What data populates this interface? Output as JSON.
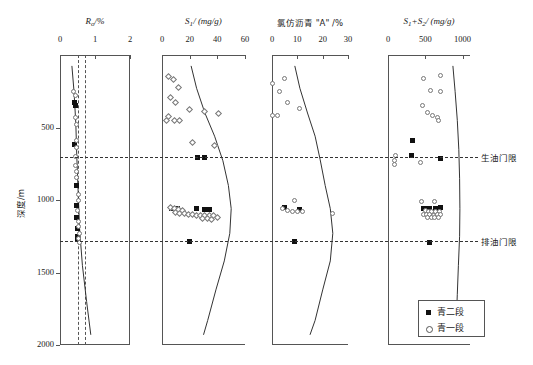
{
  "figure": {
    "y_axis": {
      "label": "深度/m",
      "ticks": [
        500,
        1000,
        1500,
        2000
      ],
      "min": 0,
      "max": 2000
    },
    "annotations": [
      {
        "name": "oil-generation-threshold",
        "label": "生油门限",
        "depth": 700
      },
      {
        "name": "oil-expulsion-threshold",
        "label": "排油门限",
        "depth": 1280
      }
    ],
    "legend": {
      "items": [
        {
          "label": "青二段",
          "marker": "filled-square"
        },
        {
          "label": "青一段",
          "marker": "open-circle"
        }
      ]
    }
  },
  "chart_data": [
    {
      "type": "scatter",
      "title": "R",
      "title_sub": "o",
      "title_unit": "/%",
      "xlabel": "Ro/%",
      "ylabel": "深度/m",
      "xlim": [
        0,
        2
      ],
      "ylim": [
        0,
        2000
      ],
      "xticks": [
        0,
        1,
        2
      ],
      "grid": false,
      "reference_lines": [
        0.5,
        0.7
      ],
      "series": [
        {
          "name": "青二段",
          "marker": "filled-square",
          "points": [
            [
              0.42,
              330
            ],
            [
              0.45,
              345
            ],
            [
              0.4,
              620
            ],
            [
              0.46,
              900
            ],
            [
              0.47,
              1040
            ],
            [
              0.48,
              1120
            ],
            [
              0.49,
              1195
            ],
            [
              0.5,
              1255
            ],
            [
              0.51,
              1275
            ]
          ]
        },
        {
          "name": "青一段",
          "marker": "open-circle",
          "points": [
            [
              0.38,
              250
            ],
            [
              0.43,
              280
            ],
            [
              0.44,
              430
            ],
            [
              0.46,
              480
            ],
            [
              0.48,
              590
            ],
            [
              0.47,
              640
            ],
            [
              0.45,
              700
            ],
            [
              0.44,
              760
            ],
            [
              0.46,
              800
            ],
            [
              0.48,
              845
            ],
            [
              0.52,
              960
            ],
            [
              0.53,
              1000
            ],
            [
              0.5,
              1075
            ],
            [
              0.52,
              1150
            ],
            [
              0.54,
              1180
            ],
            [
              0.55,
              1230
            ],
            [
              0.53,
              1265
            ],
            [
              0.56,
              1290
            ]
          ]
        }
      ],
      "trend_curve": [
        [
          0.34,
          75
        ],
        [
          0.4,
          250
        ],
        [
          0.45,
          470
        ],
        [
          0.48,
          700
        ],
        [
          0.52,
          950
        ],
        [
          0.56,
          1200
        ],
        [
          0.64,
          1450
        ],
        [
          0.76,
          1700
        ],
        [
          0.88,
          1930
        ]
      ]
    },
    {
      "type": "scatter",
      "title": "S",
      "title_sub": "1",
      "title_unit": "/ (mg/g)",
      "xlabel": "S1/(mg/g)",
      "ylabel": "深度/m",
      "xlim": [
        0,
        60
      ],
      "ylim": [
        0,
        2000
      ],
      "xticks": [
        0,
        20,
        40,
        60
      ],
      "grid": false,
      "series": [
        {
          "name": "青二段",
          "marker": "filled-square",
          "points": [
            [
              26,
              705
            ],
            [
              31,
              705
            ],
            [
              7,
              1060
            ],
            [
              9,
              1060
            ],
            [
              11,
              1060
            ],
            [
              25,
              1060
            ],
            [
              31,
              1065
            ],
            [
              34,
              1065
            ],
            [
              20,
              1285
            ]
          ]
        },
        {
          "name": "青一段",
          "marker": "open-diamond",
          "points": [
            [
              5,
              150
            ],
            [
              8,
              170
            ],
            [
              12,
              225
            ],
            [
              6,
              290
            ],
            [
              10,
              325
            ],
            [
              20,
              375
            ],
            [
              31,
              390
            ],
            [
              41,
              400
            ],
            [
              5,
              425
            ],
            [
              3,
              455
            ],
            [
              9,
              450
            ],
            [
              13,
              455
            ],
            [
              22,
              600
            ],
            [
              38,
              625
            ],
            [
              6,
              1055
            ],
            [
              9,
              1062
            ],
            [
              12,
              1068
            ],
            [
              15,
              1072
            ],
            [
              10,
              1085
            ],
            [
              13,
              1090
            ],
            [
              16,
              1095
            ],
            [
              19,
              1100
            ],
            [
              22,
              1100
            ],
            [
              25,
              1105
            ],
            [
              28,
              1108
            ],
            [
              31,
              1110
            ],
            [
              34,
              1108
            ],
            [
              37,
              1105
            ],
            [
              29,
              1128
            ],
            [
              33,
              1130
            ],
            [
              36,
              1132
            ],
            [
              40,
              1120
            ]
          ]
        }
      ],
      "trend_curve": [
        [
          21,
          75
        ],
        [
          25,
          230
        ],
        [
          31,
          400
        ],
        [
          38,
          560
        ],
        [
          44,
          730
        ],
        [
          48,
          900
        ],
        [
          50,
          1060
        ],
        [
          49,
          1230
        ],
        [
          45,
          1420
        ],
        [
          39,
          1620
        ],
        [
          33,
          1830
        ],
        [
          30,
          1930
        ]
      ]
    },
    {
      "type": "scatter",
      "title": "氯仿沥青 \"A\" /%",
      "xlabel": "氯仿沥青\"A\"/%",
      "ylabel": "深度/m",
      "xlim": [
        0,
        30
      ],
      "ylim": [
        0,
        2000
      ],
      "xticks": [
        0,
        10,
        20,
        30
      ],
      "grid": false,
      "series": [
        {
          "name": "青二段",
          "marker": "filled-square",
          "points": [
            [
              5,
              1055
            ],
            [
              11,
              1065
            ],
            [
              9,
              1285
            ]
          ]
        },
        {
          "name": "青一段",
          "marker": "open-circle",
          "points": [
            [
              5,
              160
            ],
            [
              0,
              195
            ],
            [
              3,
              250
            ],
            [
              6,
              330
            ],
            [
              11,
              370
            ],
            [
              0,
              415
            ],
            [
              2,
              420
            ],
            [
              9,
              1000
            ],
            [
              4,
              1060
            ],
            [
              6,
              1075
            ],
            [
              8,
              1080
            ],
            [
              10,
              1082
            ],
            [
              12,
              1082
            ],
            [
              24,
              1090
            ]
          ]
        }
      ],
      "trend_curve": [
        [
          9,
          75
        ],
        [
          11,
          230
        ],
        [
          14,
          400
        ],
        [
          17,
          560
        ],
        [
          19,
          720
        ],
        [
          21,
          900
        ],
        [
          23,
          1060
        ],
        [
          24,
          1230
        ],
        [
          23,
          1420
        ],
        [
          20,
          1620
        ],
        [
          17,
          1830
        ],
        [
          15,
          1930
        ]
      ]
    },
    {
      "type": "scatter",
      "title": "S",
      "title_sub": "1",
      "title_plus": "+S",
      "title_sub2": "2",
      "title_unit": "/ (mg/g)",
      "xlabel": "S1+S2/(mg/g)",
      "ylabel": "深度/m",
      "xlim": [
        0,
        1100
      ],
      "ylim": [
        0,
        2000
      ],
      "xticks": [
        0,
        500,
        1000
      ],
      "grid": false,
      "series": [
        {
          "name": "青二段",
          "marker": "filled-square",
          "points": [
            [
              330,
              590
            ],
            [
              320,
              690
            ],
            [
              700,
              715
            ],
            [
              480,
              1060
            ],
            [
              520,
              1062
            ],
            [
              560,
              1060
            ],
            [
              640,
              1058
            ],
            [
              700,
              1055
            ],
            [
              560,
              1290
            ]
          ]
        },
        {
          "name": "青一段",
          "marker": "open-circle",
          "points": [
            [
              480,
              160
            ],
            [
              700,
              140
            ],
            [
              570,
              245
            ],
            [
              700,
              250
            ],
            [
              460,
              345
            ],
            [
              530,
              395
            ],
            [
              600,
              415
            ],
            [
              660,
              430
            ],
            [
              680,
              455
            ],
            [
              100,
              690
            ],
            [
              90,
              730
            ],
            [
              90,
              755
            ],
            [
              430,
              740
            ],
            [
              450,
              1010
            ],
            [
              620,
              1010
            ],
            [
              500,
              1075
            ],
            [
              540,
              1078
            ],
            [
              590,
              1080
            ],
            [
              640,
              1080
            ],
            [
              690,
              1078
            ],
            [
              470,
              1098
            ],
            [
              510,
              1100
            ],
            [
              560,
              1102
            ],
            [
              610,
              1104
            ],
            [
              660,
              1102
            ],
            [
              700,
              1098
            ],
            [
              530,
              1120
            ],
            [
              580,
              1122
            ],
            [
              630,
              1120
            ],
            [
              680,
              1118
            ]
          ]
        }
      ],
      "trend_curve": [
        [
          870,
          75
        ],
        [
          900,
          250
        ],
        [
          930,
          450
        ],
        [
          950,
          650
        ],
        [
          960,
          850
        ],
        [
          965,
          1060
        ],
        [
          960,
          1250
        ],
        [
          945,
          1450
        ],
        [
          930,
          1650
        ],
        [
          915,
          1850
        ],
        [
          905,
          1930
        ]
      ]
    }
  ]
}
